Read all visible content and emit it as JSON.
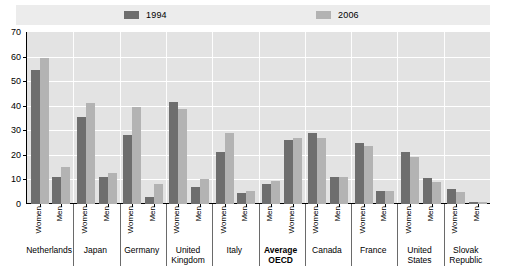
{
  "legend": {
    "entries": [
      {
        "label": "1994",
        "color": "#6e6e6e",
        "swatch_name": "legend-swatch-1994"
      },
      {
        "label": "2006",
        "color": "#b3b3b3",
        "swatch_name": "legend-swatch-2006"
      }
    ]
  },
  "axis": {
    "y_ticks": [
      "0",
      "10",
      "20",
      "30",
      "40",
      "50",
      "60",
      "70"
    ]
  },
  "chart_data": {
    "type": "bar",
    "title": "",
    "xlabel": "",
    "ylabel": "",
    "ylim": [
      0,
      70
    ],
    "ytick_step": 10,
    "grid": true,
    "legend_position": "top",
    "series": [
      {
        "name": "1994",
        "color": "#6e6e6e",
        "values": [
          54.5,
          11,
          35.5,
          11,
          28,
          3,
          41.5,
          7,
          21,
          4.5,
          8,
          26,
          29,
          11,
          25,
          5.5,
          21,
          10.5,
          6,
          1
        ]
      },
      {
        "name": "2006",
        "color": "#b3b3b3",
        "values": [
          59.5,
          15,
          41,
          12.5,
          39.5,
          8,
          38.5,
          10,
          29,
          5.5,
          9.5,
          27,
          27,
          11,
          23.5,
          5.5,
          19,
          9,
          5,
          1
        ]
      }
    ],
    "categories": [
      "Netherlands Women",
      "Netherlands Men",
      "Japan Women",
      "Japan Men",
      "Germany Women",
      "Germany Men",
      "United Kingdom Women",
      "United Kingdom Men",
      "Italy Women",
      "Italy Men",
      "Average OECD Men",
      "Average OECD Women",
      "Canada Women",
      "Canada Men",
      "France Women",
      "France Men",
      "United States Women",
      "United States Men",
      "Slovak Republic Women",
      "Slovak Republic Men"
    ],
    "groups": [
      {
        "country": "Netherlands",
        "bold": false,
        "items": [
          {
            "gender": "Women",
            "v1994": 54.5,
            "v2006": 59.5
          },
          {
            "gender": "Men",
            "v1994": 11,
            "v2006": 15
          }
        ]
      },
      {
        "country": "Japan",
        "bold": false,
        "items": [
          {
            "gender": "Women",
            "v1994": 35.5,
            "v2006": 41
          },
          {
            "gender": "Men",
            "v1994": 11,
            "v2006": 12.5
          }
        ]
      },
      {
        "country": "Germany",
        "bold": false,
        "items": [
          {
            "gender": "Women",
            "v1994": 28,
            "v2006": 39.5
          },
          {
            "gender": "Men",
            "v1994": 3,
            "v2006": 8
          }
        ]
      },
      {
        "country": "United Kingdom",
        "bold": false,
        "items": [
          {
            "gender": "Women",
            "v1994": 41.5,
            "v2006": 38.5
          },
          {
            "gender": "Men",
            "v1994": 7,
            "v2006": 10
          }
        ]
      },
      {
        "country": "Italy",
        "bold": false,
        "items": [
          {
            "gender": "Women",
            "v1994": 21,
            "v2006": 29
          },
          {
            "gender": "Men",
            "v1994": 4.5,
            "v2006": 5.5
          }
        ]
      },
      {
        "country": "Average OECD",
        "bold": true,
        "items": [
          {
            "gender": "Men",
            "v1994": 8,
            "v2006": 9.5
          },
          {
            "gender": "Women",
            "v1994": 26,
            "v2006": 27
          }
        ]
      },
      {
        "country": "Canada",
        "bold": false,
        "items": [
          {
            "gender": "Women",
            "v1994": 29,
            "v2006": 27
          },
          {
            "gender": "Men",
            "v1994": 11,
            "v2006": 11
          }
        ]
      },
      {
        "country": "France",
        "bold": false,
        "items": [
          {
            "gender": "Women",
            "v1994": 25,
            "v2006": 23.5
          },
          {
            "gender": "Men",
            "v1994": 5.5,
            "v2006": 5.5
          }
        ]
      },
      {
        "country": "United States",
        "bold": false,
        "items": [
          {
            "gender": "Women",
            "v1994": 21,
            "v2006": 19
          },
          {
            "gender": "Men",
            "v1994": 10.5,
            "v2006": 9
          }
        ]
      },
      {
        "country": "Slovak Republic",
        "bold": false,
        "items": [
          {
            "gender": "Women",
            "v1994": 6,
            "v2006": 5
          },
          {
            "gender": "Men",
            "v1994": 1,
            "v2006": 1
          }
        ]
      }
    ]
  },
  "colors": {
    "series_1994": "#6e6e6e",
    "series_2006": "#b3b3b3",
    "plot_background": "#e3e3e3",
    "legend_background": "#ececec",
    "gridline": "#ffffff"
  }
}
